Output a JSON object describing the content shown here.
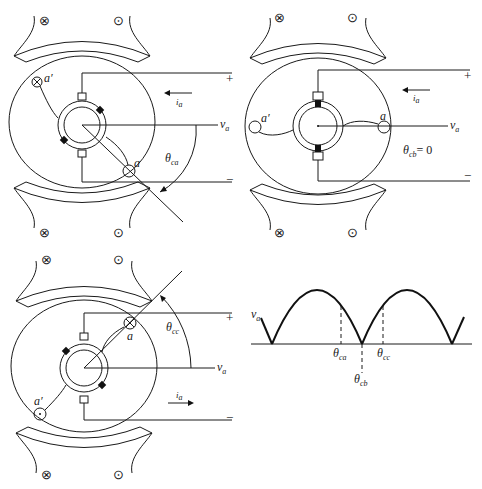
{
  "figure": {
    "panels": [
      {
        "id": "panel-a",
        "voltage_label": "v",
        "voltage_sub": "a",
        "current_label": "i",
        "current_sub": "a",
        "current_direction": "left",
        "plus": "+",
        "minus": "−",
        "coil_a": "a",
        "coil_a_prime": "a′",
        "angle_label": "θ",
        "angle_sub": "ca"
      },
      {
        "id": "panel-b",
        "voltage_label": "v",
        "voltage_sub": "a",
        "current_label": "i",
        "current_sub": "a",
        "current_direction": "left",
        "plus": "+",
        "minus": "−",
        "coil_a": "a",
        "coil_a_prime": "a′",
        "angle_label": "θ",
        "angle_sub": "cb",
        "angle_eq": "= 0"
      },
      {
        "id": "panel-c",
        "voltage_label": "v",
        "voltage_sub": "a",
        "current_label": "i",
        "current_sub": "a",
        "current_direction": "right",
        "plus": "+",
        "minus": "−",
        "coil_a": "a",
        "coil_a_prime": "a′",
        "angle_label": "θ",
        "angle_sub": "cc"
      }
    ],
    "pole_symbols": {
      "into": "⊗",
      "out": "⊙"
    },
    "waveform": {
      "y_label": "v",
      "y_sub": "a",
      "markers": [
        {
          "label": "θ",
          "sub": "ca"
        },
        {
          "label": "θ",
          "sub": "cb"
        },
        {
          "label": "θ",
          "sub": "cc"
        }
      ]
    }
  }
}
